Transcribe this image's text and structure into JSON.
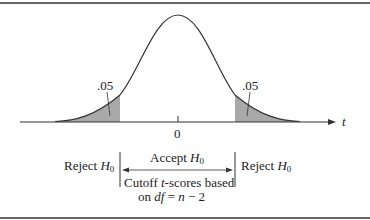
{
  "figure": {
    "axis_label": "t",
    "center_tick_label": "0",
    "left_tail_area": ".05",
    "right_tail_area": ".05",
    "reject_left": "Reject",
    "reject_right": "Reject",
    "accept": "Accept",
    "hypothesis_symbol": "H",
    "hypothesis_subscript": "0",
    "cutoff_line1_prefix": "Cutoff ",
    "cutoff_line1_t": "t",
    "cutoff_line1_suffix": "-scores based",
    "cutoff_line2_prefix": "on ",
    "cutoff_line2_df": "df",
    "cutoff_line2_eq": " = ",
    "cutoff_line2_n": "n",
    "cutoff_line2_suffix": " − 2"
  },
  "colors": {
    "border": "#555555",
    "curve": "#333333",
    "shade": "#a9a9a9",
    "text": "#222222"
  }
}
